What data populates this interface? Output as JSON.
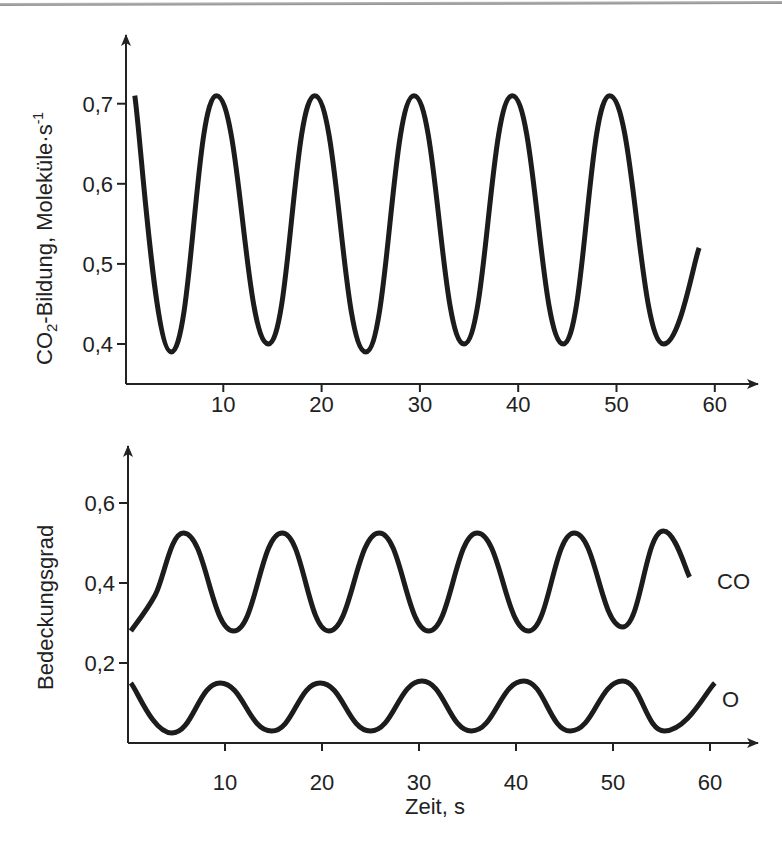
{
  "chart_data": [
    {
      "id": "co2",
      "type": "line",
      "title": "",
      "xlabel": "",
      "ylabel": "CO₂-Bildung, Moleküle·s⁻¹",
      "ylabel_parts": {
        "pre": "CO",
        "sub": "2",
        "mid": "-Bildung, Moleküle·s",
        "sup": "-1"
      },
      "xlim": [
        0,
        63
      ],
      "ylim": [
        0.36,
        0.79
      ],
      "xticks": [
        10,
        20,
        30,
        40,
        50,
        60
      ],
      "xtick_labels": [
        "10",
        "20",
        "30",
        "40",
        "50",
        "60"
      ],
      "yticks": [
        0.4,
        0.5,
        0.6,
        0.7
      ],
      "ytick_labels": [
        "0,4",
        "0,5",
        "0,6",
        "0,7"
      ],
      "grid": false,
      "legend": null,
      "series": [
        {
          "name": "CO2-Bildung",
          "points": [
            [
              1.0,
              0.71
            ],
            [
              4.7,
              0.39
            ],
            [
              9.3,
              0.71
            ],
            [
              14.6,
              0.4
            ],
            [
              19.3,
              0.71
            ],
            [
              24.5,
              0.39
            ],
            [
              29.4,
              0.71
            ],
            [
              34.5,
              0.4
            ],
            [
              39.4,
              0.71
            ],
            [
              44.6,
              0.4
            ],
            [
              49.3,
              0.71
            ],
            [
              54.8,
              0.4
            ],
            [
              58.4,
              0.52
            ]
          ]
        }
      ]
    },
    {
      "id": "coverage",
      "type": "line",
      "title": "",
      "xlabel": "Zeit, s",
      "ylabel": "Bedeckungsgrad",
      "xlim": [
        0,
        63
      ],
      "ylim": [
        0.0,
        0.74
      ],
      "xticks": [
        10,
        20,
        30,
        40,
        50,
        60
      ],
      "xtick_labels": [
        "10",
        "20",
        "30",
        "40",
        "50",
        "60"
      ],
      "yticks": [
        0.2,
        0.4,
        0.6
      ],
      "ytick_labels": [
        "0,2",
        "0,4",
        "0,6"
      ],
      "grid": false,
      "legend": "inline labels at right end of curves",
      "series": [
        {
          "name": "CO",
          "label": "CO",
          "points": [
            [
              0.3,
              0.28
            ],
            [
              2.8,
              0.37
            ],
            [
              5.7,
              0.525
            ],
            [
              10.9,
              0.28
            ],
            [
              15.9,
              0.525
            ],
            [
              20.7,
              0.28
            ],
            [
              25.9,
              0.525
            ],
            [
              31.0,
              0.28
            ],
            [
              36.0,
              0.525
            ],
            [
              41.3,
              0.28
            ],
            [
              46.0,
              0.525
            ],
            [
              51.0,
              0.29
            ],
            [
              55.2,
              0.53
            ],
            [
              57.9,
              0.415
            ]
          ]
        },
        {
          "name": "O",
          "label": "O",
          "points": [
            [
              0.3,
              0.15
            ],
            [
              4.5,
              0.025
            ],
            [
              9.5,
              0.15
            ],
            [
              14.8,
              0.03
            ],
            [
              19.8,
              0.15
            ],
            [
              25.0,
              0.03
            ],
            [
              30.3,
              0.155
            ],
            [
              35.4,
              0.03
            ],
            [
              40.8,
              0.155
            ],
            [
              45.6,
              0.03
            ],
            [
              51.0,
              0.155
            ],
            [
              55.3,
              0.03
            ],
            [
              60.5,
              0.15
            ]
          ]
        }
      ]
    }
  ]
}
